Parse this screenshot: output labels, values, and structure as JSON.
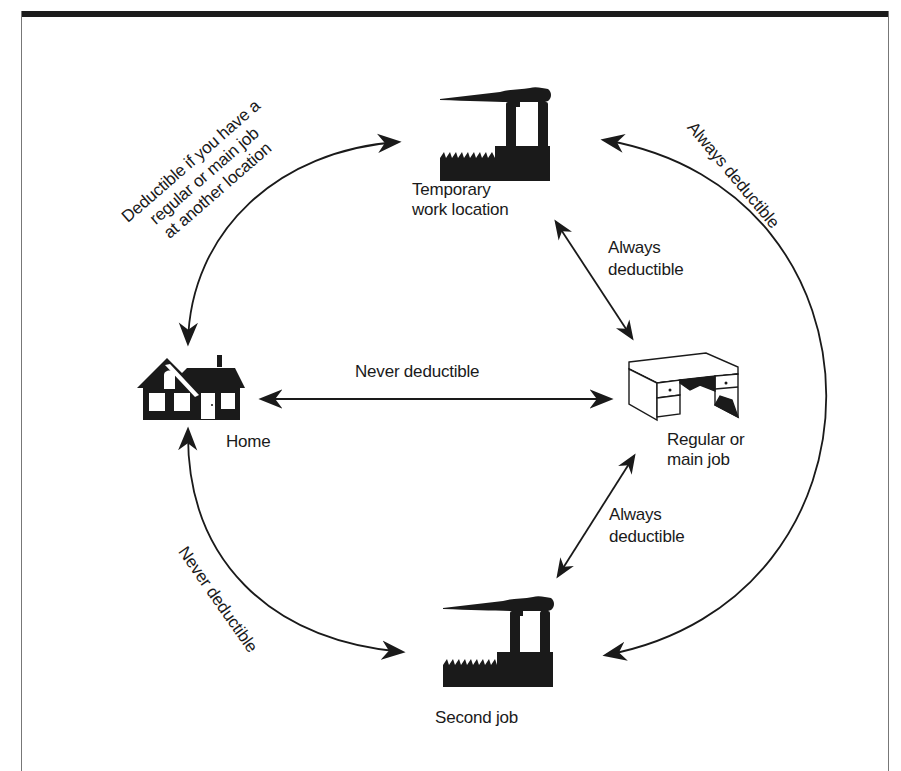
{
  "diagram": {
    "type": "travel-deductibility-cycle",
    "nodes": {
      "temporary": {
        "label_line1": "Temporary",
        "label_line2": "work location",
        "icon": "factory-icon"
      },
      "home": {
        "label": "Home",
        "icon": "house-icon"
      },
      "main_job": {
        "label_line1": "Regular or",
        "label_line2": "main job",
        "icon": "desk-icon"
      },
      "second_job": {
        "label": "Second job",
        "icon": "factory-icon"
      }
    },
    "edges": {
      "home_temporary": {
        "line1": "Deductible if you have a",
        "line2": "regular or main job",
        "line3": "at another location",
        "from": "home",
        "to": "temporary",
        "bidirectional": true
      },
      "temporary_main": {
        "line1": "Always",
        "line2": "deductible",
        "from": "temporary",
        "to": "main_job",
        "bidirectional": true
      },
      "home_main": {
        "label": "Never deductible",
        "from": "home",
        "to": "main_job",
        "bidirectional": true
      },
      "main_second": {
        "line1": "Always",
        "line2": "deductible",
        "from": "main_job",
        "to": "second_job",
        "bidirectional": true
      },
      "home_second": {
        "label": "Never deductible",
        "from": "home",
        "to": "second_job",
        "bidirectional": true
      },
      "temporary_second": {
        "label": "Always deductible",
        "from": "temporary",
        "to": "second_job",
        "bidirectional": true
      }
    },
    "colors": {
      "ink": "#1a1a1a",
      "background": "#ffffff",
      "frame_bar": "#1c1c1c"
    }
  }
}
